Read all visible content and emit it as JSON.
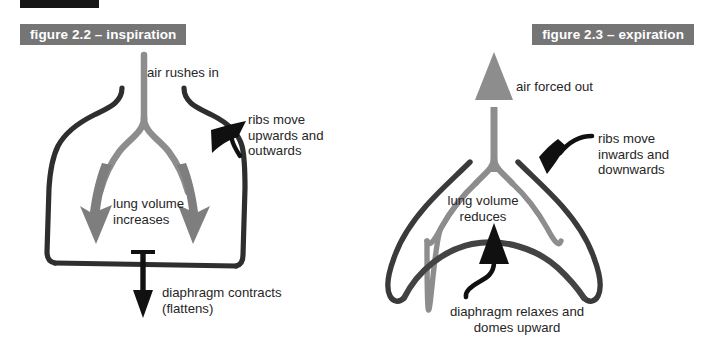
{
  "page": {
    "width": 709,
    "height": 343,
    "background": "#ffffff",
    "topic": "Breathing mechanism: inspiration and expiration"
  },
  "decor": {
    "top_black_bar": {
      "name": "top-black-bar",
      "x": 20,
      "y": 0,
      "width": 79,
      "height": 8,
      "color": "#161616"
    }
  },
  "figures": [
    {
      "id": "figure-2-2",
      "label": "figure 2.2 – inspiration",
      "label_bg": "#757575",
      "label_text_color": "#ffffff",
      "side": "left",
      "annotations": [
        {
          "name": "air-rushes-in-label",
          "text": "air rushes in",
          "x": 147,
          "y": 65,
          "align": "left"
        },
        {
          "name": "ribs-move-label",
          "text": "ribs move\nupwards and\noutwards",
          "x": 248,
          "y": 112,
          "align": "left"
        },
        {
          "name": "lung-volume-label",
          "text": "lung volume\nincreases",
          "x": 113,
          "y": 196,
          "align": "left"
        },
        {
          "name": "diaphragm-label",
          "text": "diaphragm contracts\n(flattens)",
          "x": 162,
          "y": 285,
          "align": "left"
        }
      ]
    },
    {
      "id": "figure-2-3",
      "label": "figure 2.3 – expiration",
      "label_bg": "#757575",
      "label_text_color": "#ffffff",
      "side": "right",
      "annotations": [
        {
          "name": "air-forced-out-label",
          "text": "air forced out",
          "x": 516,
          "y": 79,
          "align": "left"
        },
        {
          "name": "ribs-move-label",
          "text": "ribs move\ninwards and\ndownwards",
          "x": 598,
          "y": 131,
          "align": "left"
        },
        {
          "name": "lung-volume-label",
          "text": "lung volume\nreduces",
          "x": 483,
          "y": 193,
          "align": "center"
        },
        {
          "name": "diaphragm-label",
          "text": "diaphragm relaxes and\ndomes upward",
          "x": 517,
          "y": 304,
          "align": "center"
        }
      ]
    }
  ],
  "colors": {
    "ribcage_dark": "#2e2e2e",
    "ribcage_dark_right": "#3a3a3a",
    "trachea_gray": "#8d8d8d",
    "lung_outline_gray": "#8d8d8d",
    "airflow_arrow_gray": "#7e7e7e",
    "diaphragm_dark": "#434343",
    "pointer_black": "#101010",
    "text": "#262626",
    "label_bg": "#757575"
  },
  "elements": {
    "left": {
      "trachea": "trachea-and-bronchi-gray",
      "ribcage": "ribcage-outline-dark",
      "airflow_arrows": [
        "airflow-arrow-left",
        "airflow-arrow-right"
      ],
      "diaphragm_arrow": "diaphragm-down-arrow",
      "ribs_pointer": "ribs-pointer-arrow"
    },
    "right": {
      "trachea": "trachea-and-bronchi-gray",
      "lung_outline": "lung-outline-gray",
      "ribcage": "ribcage-outline-dark",
      "diaphragm": "diaphragm-dome-line",
      "airflow_arrow": "airflow-up-arrow",
      "diaphragm_arrow": "diaphragm-up-arrow",
      "ribs_pointer": "ribs-pointer-arrow"
    }
  }
}
